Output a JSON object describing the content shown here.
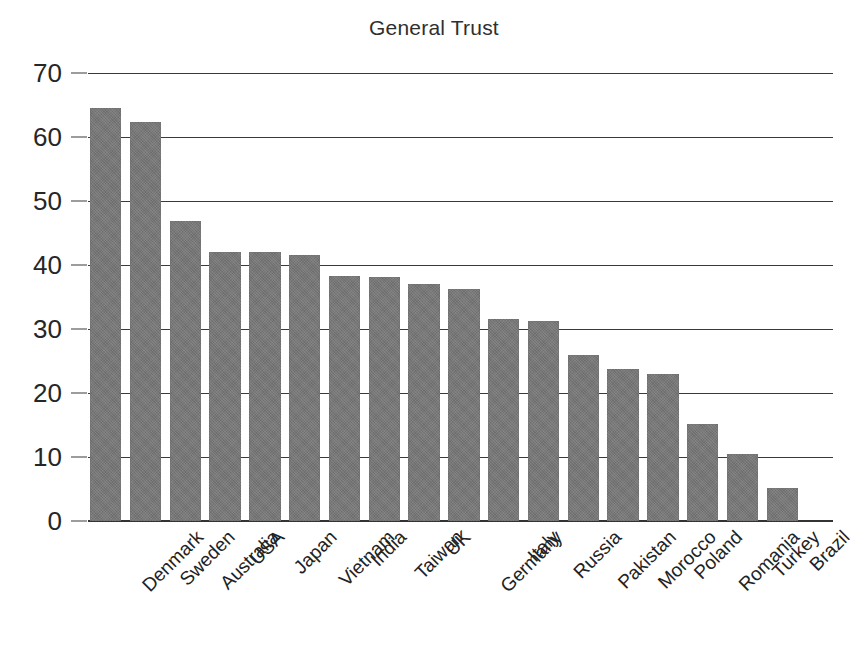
{
  "chart_data": {
    "type": "bar",
    "title": "General Trust",
    "xlabel": "",
    "ylabel": "",
    "ylim": [
      0,
      70
    ],
    "ytick_values": [
      0,
      10,
      20,
      30,
      40,
      50,
      60,
      70
    ],
    "ytick_labels": [
      "0",
      "10",
      "20",
      "30",
      "40",
      "50",
      "60",
      "70"
    ],
    "grid": true,
    "legend": false,
    "bar_color": "#777777",
    "categories": [
      "Denmark",
      "Sweden",
      "Australia",
      "USA",
      "Japan",
      "Vietnam",
      "India",
      "Taiwan",
      "UK",
      "Germany",
      "Italy",
      "Russia",
      "Pakistan",
      "Morocco",
      "Poland",
      "Romania",
      "Turkey",
      "Brazil"
    ],
    "values": [
      64.5,
      62.3,
      46.8,
      42.1,
      42.0,
      41.5,
      38.3,
      38.2,
      37.0,
      36.2,
      31.6,
      31.3,
      26.0,
      23.7,
      23.0,
      15.2,
      10.5,
      5.1
    ]
  }
}
